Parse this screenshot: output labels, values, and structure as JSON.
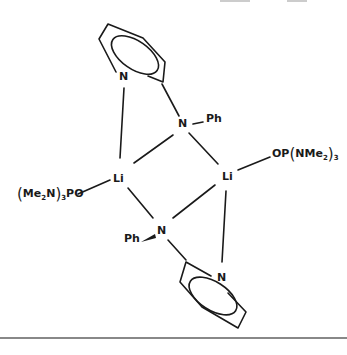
{
  "diagram": {
    "atoms": {
      "n_pyridine_top": "N",
      "n_amide_top": "N",
      "ph_top": "Ph",
      "li_left": "Li",
      "li_right": "Li",
      "n_amide_bottom": "N",
      "ph_bottom": "Ph",
      "n_pyridine_bottom": "N"
    },
    "ligand_left": {
      "me": "Me",
      "me_sub": "2",
      "n": "N",
      "group_sub": "3",
      "po": "PO"
    },
    "ligand_right": {
      "op": "OP",
      "n": "N",
      "me": "Me",
      "me_sub": "2",
      "group_sub": "3"
    }
  }
}
